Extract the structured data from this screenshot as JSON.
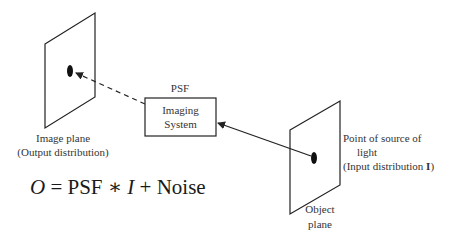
{
  "diagram": {
    "image_plane": {
      "label_line1": "Image plane",
      "label_line2": "(Output distribution)"
    },
    "imaging_system": {
      "header": "PSF",
      "line1": "Imaging",
      "line2": "System"
    },
    "object_plane": {
      "label_line1": "Object",
      "label_line2": "plane"
    },
    "source": {
      "line1": "Point of source of",
      "line2": "light",
      "line3_prefix": "(Input distribution ",
      "line3_symbol": "I",
      "line3_suffix": ")"
    },
    "equation": {
      "lhs": "O",
      "equals": " = PSF ∗ ",
      "var": "I",
      "rest": " + Noise"
    },
    "colors": {
      "stroke": "#222222",
      "text": "#333333",
      "background": "#ffffff"
    }
  }
}
